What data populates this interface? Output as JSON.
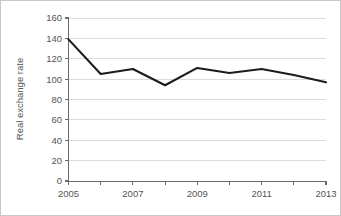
{
  "chart_data": {
    "type": "line",
    "title": "",
    "subtitle": "",
    "xlabel": "",
    "ylabel": "Real exchange rate",
    "x": [
      2005,
      2006,
      2007,
      2008,
      2009,
      2010,
      2011,
      2012,
      2013
    ],
    "categories": [
      "2005",
      "2006",
      "2007",
      "2008",
      "2009",
      "2010",
      "2011",
      "2012",
      "2013"
    ],
    "values": [
      139,
      105,
      110,
      94,
      111,
      106,
      110,
      104,
      97
    ],
    "series": [
      {
        "name": "Real exchange rate",
        "values": [
          139,
          105,
          110,
          94,
          111,
          106,
          110,
          104,
          97
        ]
      }
    ],
    "ylim": [
      0,
      160
    ],
    "xlim": [
      2005,
      2013
    ],
    "ytick_labels": [
      "0",
      "20",
      "40",
      "60",
      "80",
      "100",
      "120",
      "140",
      "160"
    ],
    "ytick_values": [
      0,
      20,
      40,
      60,
      80,
      100,
      120,
      140,
      160
    ],
    "xtick_values": [
      2005,
      2006,
      2007,
      2008,
      2009,
      2010,
      2011,
      2012,
      2013
    ],
    "xtick_labels_shown": [
      "2005",
      "",
      "2007",
      "",
      "2009",
      "",
      "2011",
      "",
      "2013"
    ],
    "grid": "horizontal",
    "legend": "none",
    "annotations": [],
    "colors": {
      "line": "#1c1c1c",
      "grid": "#dcdcdc",
      "axis": "#6b6b6b",
      "text": "#555555",
      "background": "#ffffff",
      "border": "#c8c8c8"
    }
  }
}
